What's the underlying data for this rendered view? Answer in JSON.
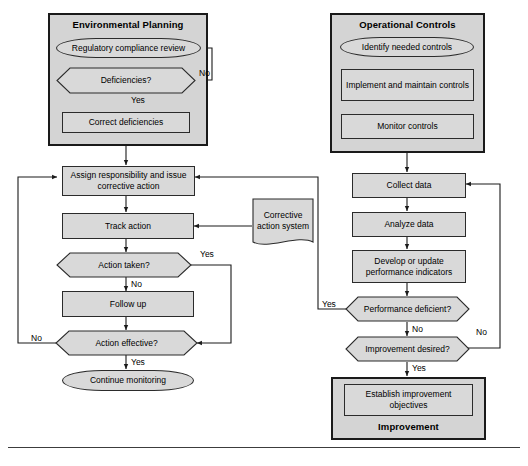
{
  "diagram": {
    "colors": {
      "group_fill": "#d4d4d4",
      "node_fill": "#d9d9d9",
      "stroke": "#2b2b2b",
      "group_stroke": "#1a1a1a",
      "background": "#ffffff"
    },
    "groups": [
      {
        "id": "environmental-planning",
        "title": "Environmental Planning"
      },
      {
        "id": "operational-controls",
        "title": "Operational Controls"
      },
      {
        "id": "improvement",
        "title": "Improvement"
      }
    ],
    "nodes": {
      "regulatory_compliance_review": "Regulatory compliance review",
      "deficiencies": "Deficiencies?",
      "correct_deficiencies": "Correct deficiencies",
      "assign_responsibility": "Assign responsibility and issue corrective action",
      "track_action": "Track action",
      "action_taken": "Action taken?",
      "follow_up": "Follow up",
      "action_effective": "Action effective?",
      "continue_monitoring": "Continue monitoring",
      "corrective_action_system": "Corrective action system",
      "identify_needed_controls": "Identify needed controls",
      "implement_maintain_controls": "Implement and maintain controls",
      "monitor_controls": "Monitor controls",
      "collect_data": "Collect data",
      "analyze_data": "Analyze data",
      "develop_update_indicators": "Develop or update performance indicators",
      "performance_deficient": "Performance deficient?",
      "improvement_desired": "Improvement desired?",
      "establish_improvement_objectives": "Establish improvement objectives"
    },
    "edge_labels": {
      "deficiencies_no": "No",
      "deficiencies_yes": "Yes",
      "action_taken_yes": "Yes",
      "action_taken_no": "No",
      "action_effective_no": "No",
      "action_effective_yes": "Yes",
      "performance_deficient_yes": "Yes",
      "performance_deficient_no": "No",
      "improvement_desired_no": "No",
      "improvement_desired_yes": "Yes"
    }
  }
}
